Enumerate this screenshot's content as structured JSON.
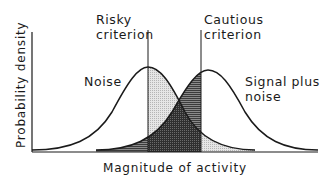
{
  "diagram": {
    "y_axis_label": "Probability density",
    "x_axis_label": "Magnitude of activity",
    "criteria": [
      {
        "line1": "Risky",
        "line2": "criterion"
      },
      {
        "line1": "Cautious",
        "line2": "criterion"
      }
    ],
    "curves": [
      {
        "label": "Noise"
      },
      {
        "label_line1": "Signal plus",
        "label_line2": "noise"
      }
    ],
    "colors": {
      "ink": "#1a1a1a",
      "light_shade": "#d9d9d9",
      "dark_shade": "#3a3a3a",
      "mid_shade": "#7a7a7a"
    }
  }
}
